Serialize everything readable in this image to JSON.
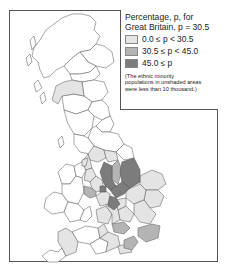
{
  "legend": {
    "title_line1": "Percentage, p, for",
    "title_line2": "Great Britain, p = 30.5",
    "items": [
      {
        "label": "0.0 ≤ p < 30.5",
        "color": "#e4e4e4"
      },
      {
        "label": "30.5 ≤ p < 45.0",
        "color": "#b4b4b4"
      },
      {
        "label": "45.0 ≤ p",
        "color": "#7c7c7c"
      }
    ],
    "note_line1": "(The ethnic minority",
    "note_line2": "populations in unshaded areas",
    "note_line3": "were less than 10 thousand.)"
  },
  "colors": {
    "unshaded": "#ffffff",
    "border": "#555555",
    "outline": "#6a6a6a"
  }
}
